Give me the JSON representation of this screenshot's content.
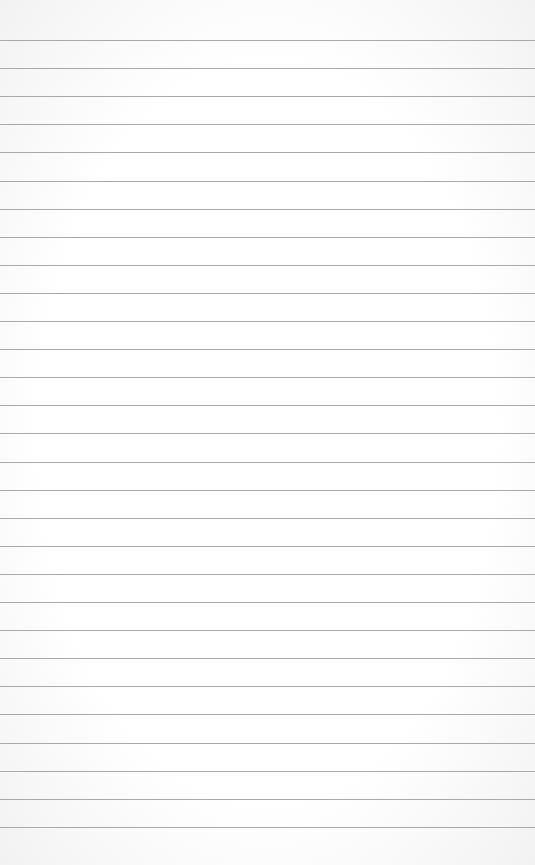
{
  "paper": {
    "background_color": "#ffffff",
    "line_color": "#a9a9a9",
    "first_line_y": 40,
    "line_spacing": 28.1,
    "line_count": 29
  }
}
